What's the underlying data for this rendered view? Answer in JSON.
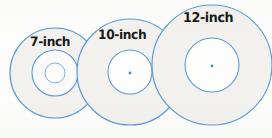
{
  "figure": {
    "background_color": "#fdfdfb"
  },
  "style": {
    "stroke_color": "#5b9bd5",
    "stroke_color_dark": "#4a8dc9",
    "fill_color": "#f2f1ed",
    "inner_fill_color": "#fdfdfb",
    "dot_color": "#4a8dc9",
    "label_color": "#1a1a1a",
    "stroke_width": "1.2"
  },
  "circles": [
    {
      "id": "seven-inch",
      "label": "7-inch",
      "cx": 55,
      "cy": 73,
      "outer_r": 45,
      "middle_r": 23,
      "inner_r": 10,
      "has_center_dot": false
    },
    {
      "id": "ten-inch",
      "label": "10-inch",
      "cx": 130,
      "cy": 72,
      "outer_r": 53,
      "middle_r": 22,
      "inner_r": 0,
      "has_center_dot": true,
      "dot_r": 1.4
    },
    {
      "id": "twelve-inch",
      "label": "12-inch",
      "cx": 212,
      "cy": 65,
      "outer_r": 60,
      "middle_r": 27,
      "inner_r": 0,
      "has_center_dot": true,
      "dot_r": 1.4
    }
  ],
  "chart_data": {
    "type": "diagram",
    "categories": [
      "7-inch",
      "10-inch",
      "12-inch"
    ],
    "values": [
      7,
      10,
      12
    ],
    "unit": "inch",
    "xlabel": "",
    "ylabel": "Diameter",
    "legend": []
  }
}
